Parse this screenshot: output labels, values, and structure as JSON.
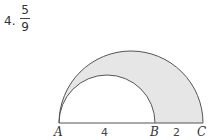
{
  "answer": {
    "number": "4.",
    "fraction": {
      "numerator": "5",
      "denominator": "9"
    }
  },
  "figure": {
    "points": [
      "A",
      "B",
      "C"
    ],
    "segments": [
      {
        "from": "A",
        "to": "B",
        "length_label": "4"
      },
      {
        "from": "B",
        "to": "C",
        "length_label": "2"
      }
    ],
    "labels": {
      "A": "A",
      "B": "B",
      "C": "C",
      "AB": "4",
      "BC": "2"
    },
    "colors": {
      "shade": "#e6e6e6",
      "stroke": "#555555"
    }
  }
}
